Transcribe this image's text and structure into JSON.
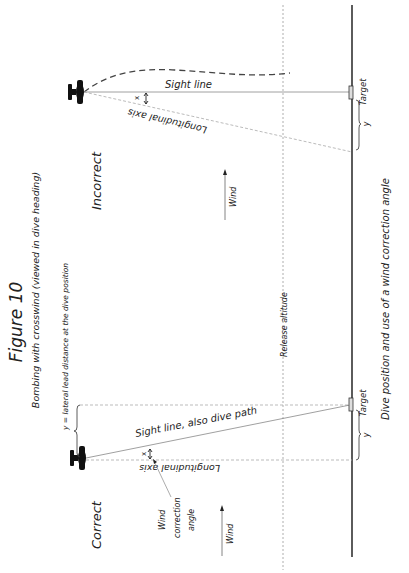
{
  "figure": {
    "title": "Figure 10",
    "subtitle": "Bombing with crosswind (viewed in dive heading)",
    "caption": "Dive position and use of a wind correction angle",
    "orientation": "rotated 90° counter-clockwise"
  },
  "common": {
    "release_altitude_label": "Release altitude",
    "ground_color": "#333333",
    "line_color": "#888888"
  },
  "panels": {
    "incorrect": {
      "label": "Incorrect",
      "sight_line_label": "Sight line",
      "longitudinal_axis_label": "Longitudinal axis",
      "angle_label": "x",
      "target_label": "Target",
      "lead_label": "y",
      "wind_label": "Wind"
    },
    "correct": {
      "label": "Correct",
      "sight_line_label": "Sight line, also dive path",
      "longitudinal_axis_label": "Longitudinal axis",
      "angle_label": "x",
      "target_label": "Target",
      "lead_label": "y",
      "lead_definition": "y = lateral lead distance at the dive position",
      "wind_correction_label_1": "Wind",
      "wind_correction_label_2": "correction",
      "wind_correction_label_3": "angle",
      "wind_label": "Wind"
    }
  }
}
